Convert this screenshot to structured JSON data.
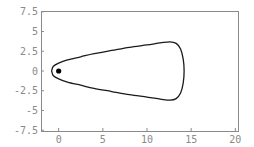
{
  "chart_data": {
    "type": "line",
    "title": "",
    "xlabel": "",
    "ylabel": "",
    "xlim": [
      -2,
      20.3
    ],
    "ylim": [
      -7.6,
      7.6
    ],
    "grid": false,
    "legend": null,
    "x_ticks": [
      0,
      5,
      10,
      15,
      20
    ],
    "x_tick_labels": [
      "0",
      "5",
      "10",
      "15",
      "20"
    ],
    "y_ticks": [
      7.5,
      5,
      2.5,
      0,
      -2.5,
      -5,
      -7.5
    ],
    "y_tick_labels": [
      "7.5",
      "5",
      "2.5",
      "0",
      "-2.5",
      "-5",
      "-7.5"
    ],
    "series": [
      {
        "name": "closed orbit",
        "closed": true,
        "points": [
          [
            -0.8,
            0.0
          ],
          [
            -0.6,
            0.6
          ],
          [
            0.0,
            1.0
          ],
          [
            1.0,
            1.4
          ],
          [
            2.5,
            1.8
          ],
          [
            4.0,
            2.2
          ],
          [
            6.0,
            2.6
          ],
          [
            8.0,
            3.0
          ],
          [
            10.0,
            3.3
          ],
          [
            11.5,
            3.55
          ],
          [
            12.6,
            3.7
          ],
          [
            13.3,
            3.5
          ],
          [
            13.8,
            2.8
          ],
          [
            14.1,
            1.5
          ],
          [
            14.2,
            0.0
          ],
          [
            14.1,
            -1.5
          ],
          [
            13.8,
            -2.8
          ],
          [
            13.3,
            -3.5
          ],
          [
            12.6,
            -3.7
          ],
          [
            11.5,
            -3.55
          ],
          [
            10.0,
            -3.3
          ],
          [
            8.0,
            -3.0
          ],
          [
            6.0,
            -2.6
          ],
          [
            4.0,
            -2.2
          ],
          [
            2.5,
            -1.8
          ],
          [
            1.0,
            -1.4
          ],
          [
            0.0,
            -1.0
          ],
          [
            -0.6,
            -0.6
          ],
          [
            -0.8,
            0.0
          ]
        ]
      }
    ],
    "markers": [
      {
        "name": "fixed point",
        "x": 0,
        "y": 0
      }
    ],
    "colors": {
      "curve": "#1a1a1a",
      "frame": "#8a8a8a",
      "marker": "#000000"
    }
  }
}
